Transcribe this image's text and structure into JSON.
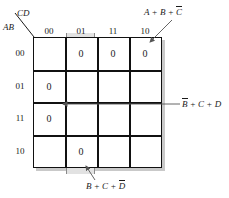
{
  "diagram": {
    "type": "karnaugh-map",
    "variables": [
      "A",
      "B",
      "C",
      "D"
    ],
    "corner_label_top": "CD",
    "corner_label_bottom": "AB",
    "column_headers": [
      "00",
      "01",
      "11",
      "10"
    ],
    "row_headers": [
      "00",
      "01",
      "11",
      "10"
    ],
    "cells": [
      [
        "",
        "0",
        "0",
        "0"
      ],
      [
        "0",
        "",
        "",
        ""
      ],
      [
        "0",
        "",
        "",
        ""
      ],
      [
        "",
        "0",
        "",
        ""
      ]
    ],
    "cell_value": "0",
    "colors": {
      "group_fill": "#e2e2e2",
      "group_stroke": "#8a8a8a",
      "grid_line": "#111111",
      "shadow": "#c9c9c9",
      "text": "#1a1a1a"
    },
    "annotations": {
      "top": {
        "terms": [
          "A",
          "+",
          "B",
          "+",
          "C"
        ],
        "text_plain": "A + B + C'",
        "prefix": "A + B + ",
        "overlined": "C"
      },
      "right": {
        "text_plain": "B' + C + D",
        "overlined": "B",
        "suffix": " + C + D"
      },
      "bottom": {
        "text_plain": "B + C + D'",
        "prefix": "B + C + ",
        "overlined": "D"
      }
    }
  }
}
